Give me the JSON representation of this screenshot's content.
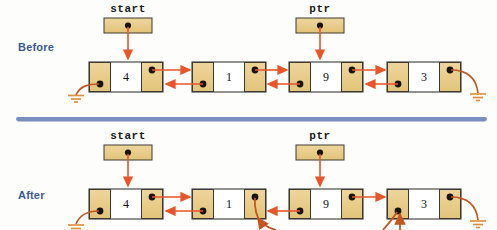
{
  "diagram": {
    "divider": {
      "y": 119,
      "x1": 18,
      "x2": 485,
      "color": "#7a8ebf"
    }
  },
  "colors": {
    "node_fill_pointer": "#e8cd8d",
    "node_fill_value": "#ffffff",
    "node_stroke": "#3d3a33",
    "arrow": "#e8552a",
    "arrow_dark": "#c4561f",
    "ground": "#e0903c",
    "label_blue": "#3c5a8c",
    "divider_blue": "#7a8ebf",
    "dot": "#17140f",
    "background": "#fdfdfc"
  },
  "sections": [
    {
      "id": "before",
      "label": "Before",
      "label_x": 18,
      "label_y": 41,
      "pointers": [
        {
          "name": "start",
          "label": "start",
          "box_x": 104,
          "box_y": 18,
          "box_w": 48,
          "box_h": 15,
          "dot_x": 128,
          "dot_y": 25,
          "label_x": 104,
          "label_y": 4,
          "target_x": 128,
          "target_y": 61
        },
        {
          "name": "ptr",
          "label": "ptr",
          "box_x": 296,
          "box_y": 18,
          "box_w": 48,
          "box_h": 15,
          "dot_x": 320,
          "dot_y": 25,
          "label_x": 296,
          "label_y": 4,
          "target_x": 320,
          "target_y": 61
        }
      ],
      "nodes": [
        {
          "value": "4",
          "x": 89,
          "y": 62,
          "w": 74,
          "h": 30
        },
        {
          "value": "1",
          "x": 192,
          "y": 62,
          "w": 74,
          "h": 30
        },
        {
          "value": "9",
          "x": 289,
          "y": 62,
          "w": 74,
          "h": 30
        },
        {
          "value": "3",
          "x": 387,
          "y": 62,
          "w": 74,
          "h": 30
        }
      ],
      "head_ground": {
        "ground_x": 68,
        "ground_y": 95,
        "dot_x": 100,
        "dot_y": 84
      },
      "tail_ground": {
        "ground_x": 481,
        "ground_y": 95,
        "dot_x": 450,
        "dot_y": 71
      }
    },
    {
      "id": "after",
      "label": "After",
      "label_x": 18,
      "label_y": 189,
      "pointers": [
        {
          "name": "start",
          "label": "start",
          "box_x": 104,
          "box_y": 145,
          "box_w": 48,
          "box_h": 15,
          "dot_x": 128,
          "dot_y": 152,
          "label_x": 104,
          "label_y": 131,
          "target_x": 128,
          "target_y": 188
        },
        {
          "name": "ptr",
          "label": "ptr",
          "box_x": 296,
          "box_y": 145,
          "box_w": 48,
          "box_h": 15,
          "dot_x": 320,
          "dot_y": 152,
          "label_x": 296,
          "label_y": 131,
          "target_x": 320,
          "target_y": 188
        }
      ],
      "nodes": [
        {
          "value": "4",
          "x": 89,
          "y": 189,
          "w": 74,
          "h": 30
        },
        {
          "value": "1",
          "x": 192,
          "y": 189,
          "w": 74,
          "h": 30
        },
        {
          "value": "9",
          "x": 289,
          "y": 189,
          "w": 74,
          "h": 30
        },
        {
          "value": "3",
          "x": 387,
          "y": 189,
          "w": 74,
          "h": 30
        }
      ],
      "head_ground": {
        "ground_x": 68,
        "ground_y": 222,
        "dot_x": 100,
        "dot_y": 211
      },
      "tail_ground": {
        "ground_x": 481,
        "ground_y": 222,
        "dot_x": 450,
        "dot_y": 198
      }
    }
  ]
}
